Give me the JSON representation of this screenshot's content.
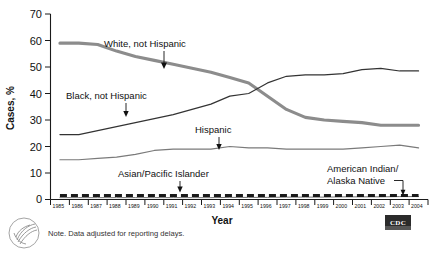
{
  "chart_data": {
    "type": "line",
    "title": "",
    "xlabel": "Year",
    "ylabel": "Cases, %",
    "xlim": [
      1985,
      2004
    ],
    "ylim": [
      0,
      70
    ],
    "yticks": [
      0,
      10,
      20,
      30,
      40,
      50,
      60,
      70
    ],
    "grid": false,
    "legend_position": "inline-annotations",
    "categories": [
      "1985",
      "1986",
      "1987",
      "1988",
      "1989",
      "1990",
      "1991",
      "1992",
      "1993",
      "1994",
      "1995",
      "1996",
      "1997",
      "1998",
      "1999",
      "2000",
      "2001",
      "2002",
      "2003",
      "2004"
    ],
    "series": [
      {
        "name": "White, not Hispanic",
        "color": "#8c8c8c",
        "style": "solid-thick",
        "values": [
          59,
          59,
          58.5,
          56,
          54,
          52.5,
          51,
          49.5,
          48,
          46,
          44,
          39,
          34,
          31,
          30,
          29.5,
          29,
          28,
          28,
          28
        ]
      },
      {
        "name": "Black, not Hispanic",
        "color": "#333333",
        "style": "solid-thin",
        "values": [
          24.5,
          24.5,
          26,
          27.5,
          29,
          30.5,
          32,
          34,
          36,
          39,
          40,
          44,
          46.5,
          47,
          47,
          47.5,
          49,
          49.5,
          48.5,
          48.5
        ]
      },
      {
        "name": "Hispanic",
        "color": "#7a7a7a",
        "style": "solid-thin",
        "values": [
          15,
          15,
          15.5,
          16,
          17,
          18.5,
          19,
          19,
          19,
          20,
          19.5,
          19.5,
          19,
          19,
          19,
          19,
          19.5,
          20,
          20.5,
          19.5
        ]
      },
      {
        "name": "Asian/Pacific Islander",
        "color": "#707070",
        "style": "solid-flat",
        "values": [
          0.7,
          0.7,
          0.7,
          0.7,
          0.7,
          0.7,
          0.7,
          0.7,
          0.7,
          0.8,
          0.8,
          0.8,
          0.9,
          0.9,
          0.9,
          1.0,
          1.0,
          1.0,
          1.1,
          1.1
        ]
      },
      {
        "name": "American Indian/Alaska Native",
        "color": "#1a1a1a",
        "style": "dashed-thick",
        "values": [
          1.5,
          1.5,
          1.5,
          1.5,
          1.5,
          1.5,
          1.5,
          1.5,
          1.5,
          1.5,
          1.5,
          1.5,
          1.5,
          1.5,
          1.5,
          1.5,
          1.5,
          1.5,
          1.5,
          1.5
        ]
      }
    ],
    "annotations": [
      {
        "text": "White, not Hispanic",
        "marker": "arrow-down"
      },
      {
        "text": "Black, not Hispanic",
        "marker": "arrow-down"
      },
      {
        "text": "Hispanic",
        "marker": "arrow-down"
      },
      {
        "text": "Asian/Pacific Islander",
        "marker": "arrow-down"
      },
      {
        "text": "American Indian/",
        "marker": "elbow-leader"
      },
      {
        "text": "Alaska Native",
        "marker": "elbow-leader"
      }
    ]
  },
  "footer": {
    "note": "Note. Data adjusted for reporting delays.",
    "logo_label": "CDC",
    "seal_name": "hhs-seal"
  }
}
